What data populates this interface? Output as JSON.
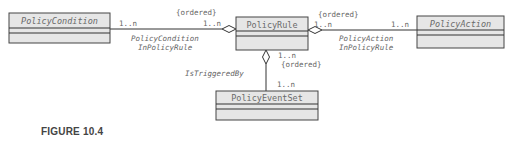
{
  "classes": {
    "policy_condition": {
      "name": "PolicyCondition",
      "abstract": true
    },
    "policy_rule": {
      "name": "PolicyRule",
      "abstract": false
    },
    "policy_action": {
      "name": "PolicyAction",
      "abstract": true
    },
    "policy_event_set": {
      "name": "PolicyEventSet",
      "abstract": false
    }
  },
  "associations": {
    "condition_in_rule": {
      "name_line1": "PolicyCondition",
      "name_line2": "InPolicyRule",
      "constraint": "{ordered}",
      "mult_condition": "1..n",
      "mult_rule": "1..n"
    },
    "action_in_rule": {
      "name_line1": "PolicyAction",
      "name_line2": "InPolicyRule",
      "constraint": "{ordered}",
      "mult_rule": "1..n",
      "mult_action": "1..n"
    },
    "is_triggered_by": {
      "name": "IsTriggeredBy",
      "constraint": "{ordered}",
      "mult_rule": "1..n",
      "mult_event_set": "1..n"
    }
  },
  "colors": {
    "box_fill": "#e6e6e6",
    "line": "#333333",
    "text": "#666666"
  },
  "caption": "FIGURE 10.4"
}
